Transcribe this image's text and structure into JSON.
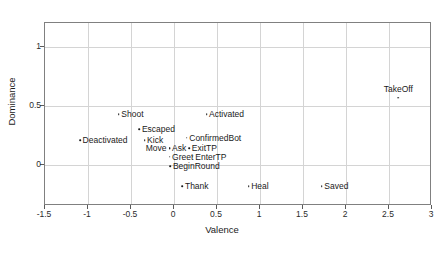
{
  "chart_data": {
    "type": "scatter",
    "title": "",
    "xlabel": "Valence",
    "ylabel": "Dominance",
    "xlim": [
      -1.5,
      3
    ],
    "ylim": [
      -0.35,
      1.2
    ],
    "grid": true,
    "legend": "none",
    "xticks": [
      "-1.5",
      "-1",
      "-0.5",
      "0",
      "0.5",
      "1",
      "1.5",
      "2",
      "2.5",
      "3"
    ],
    "xtick_values": [
      -1.5,
      -1,
      -0.5,
      0,
      0.5,
      1,
      1.5,
      2,
      2.5,
      3
    ],
    "yticks": [
      "0",
      "0.5",
      "1"
    ],
    "ytick_values": [
      0,
      0.5,
      1
    ],
    "points": [
      {
        "label": "Deactivated",
        "x": -1.08,
        "y": 0.2,
        "label_pos": "right"
      },
      {
        "label": "Shoot",
        "x": -0.63,
        "y": 0.42,
        "label_pos": "right"
      },
      {
        "label": "Escaped",
        "x": -0.39,
        "y": 0.29,
        "label_pos": "right"
      },
      {
        "label": "Kick",
        "x": -0.33,
        "y": 0.2,
        "label_pos": "right"
      },
      {
        "label": "Move",
        "x": -0.04,
        "y": 0.13,
        "label_pos": "left"
      },
      {
        "label": "Ask",
        "x": -0.04,
        "y": 0.13,
        "label_pos": "right"
      },
      {
        "label": "Greet",
        "x": -0.04,
        "y": 0.06,
        "label_pos": "right"
      },
      {
        "label": "ConfirmedBot",
        "x": 0.16,
        "y": 0.22,
        "label_pos": "right"
      },
      {
        "label": "ExitTP",
        "x": 0.19,
        "y": 0.13,
        "label_pos": "right"
      },
      {
        "label": "EnterTP",
        "x": 0.23,
        "y": 0.06,
        "label_pos": "right"
      },
      {
        "label": "Activated",
        "x": 0.39,
        "y": 0.42,
        "label_pos": "right"
      },
      {
        "label": "BeginRound",
        "x": -0.03,
        "y": -0.02,
        "label_pos": "right"
      },
      {
        "label": "Thank",
        "x": 0.11,
        "y": -0.19,
        "label_pos": "right"
      },
      {
        "label": "Heal",
        "x": 0.88,
        "y": -0.19,
        "label_pos": "right"
      },
      {
        "label": "Saved",
        "x": 1.73,
        "y": -0.19,
        "label_pos": "right"
      },
      {
        "label": "TakeOff",
        "x": 2.62,
        "y": 0.56,
        "label_pos": "above"
      }
    ],
    "colors": {
      "marker": "#1a1a1a",
      "grid": "#d4d4d4",
      "axis": "#808080",
      "text": "#1a1a1a",
      "background": "#ffffff"
    }
  }
}
